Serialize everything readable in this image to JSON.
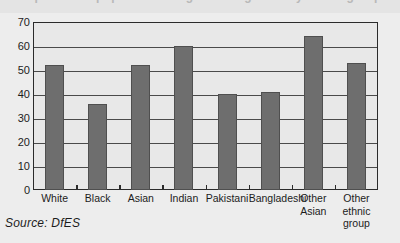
{
  "title_strip": {
    "ghost_text": "Proportion of pupils achieving 5+ A*-C grades by ethnic group"
  },
  "source": {
    "label": "Source: DfES"
  },
  "colors": {
    "bar_fill": "#6e6e6e",
    "bar_border": "#4f4f4f",
    "frame": "#2b2b2b",
    "plot_background": "#e8e8e8",
    "page_background": "#ededed",
    "gridline": "#4a4a4a",
    "text": "#1c1c1c"
  },
  "chart_data": {
    "type": "bar",
    "title": "",
    "xlabel": "",
    "ylabel": "",
    "categories": [
      "White",
      "Black",
      "Asian",
      "Indian",
      "Pakistani",
      "Bangladeshi",
      "Other\nAsian",
      "Other\nethnic group"
    ],
    "values": [
      52,
      36,
      52,
      60,
      40,
      41,
      64,
      53
    ],
    "ylim": [
      0,
      70
    ],
    "yticks": [
      0,
      10,
      20,
      30,
      40,
      50,
      60,
      70
    ],
    "ytick_labels": [
      "0",
      "10",
      "20",
      "30",
      "40",
      "50",
      "60",
      "70"
    ],
    "grid": true,
    "legend": false,
    "series": [
      {
        "name": "",
        "values": [
          52,
          36,
          52,
          60,
          40,
          41,
          64,
          53
        ]
      }
    ]
  }
}
